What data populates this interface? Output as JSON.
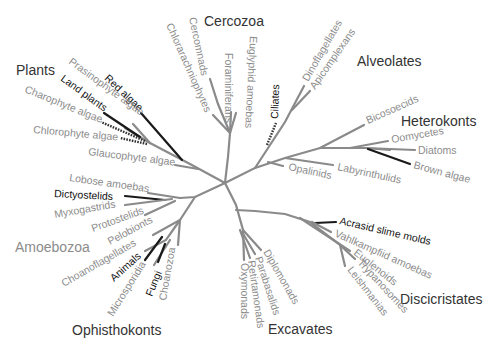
{
  "diagram": {
    "type": "unrooted phylogenetic tree",
    "colors": {
      "branch": "#8a8a8a",
      "highlight_branch": "#1a1a1a",
      "label": "#8c8c8c",
      "highlight_label": "#111111",
      "group_label": "#333333"
    },
    "groups": {
      "cercozoa": "Cercozoa",
      "alveolates": "Alveolates",
      "heterokonts": "Heterokonts",
      "plants": "Plants",
      "amoebozoa": "Amoebozoa",
      "ophisthokonts": "Ophisthokonts",
      "excavates": "Excavates",
      "discicristates": "Discicristates"
    },
    "taxa": {
      "chlorarachniophytes": "Chlorarachniophytes",
      "cercomnads": "Cercomnads",
      "foraminiferans": "Foraminiferans",
      "euglyphid_amoebas": "Euglyphid amoebas",
      "ciliates": "Ciliates",
      "dinoflagellates": "Dinoflagellates",
      "apicomplexans": "Apicomplexans",
      "bicosoecids": "Bicosoecids",
      "oomycetes": "Oomycetes",
      "diatoms": "Diatoms",
      "brown_algae": "Brown algae",
      "labyrinthulids": "Labyrinthulids",
      "opalinids": "Opalinids",
      "red_algae": "Red algae",
      "prasinophyte_algae": "Prasinophyte algae",
      "land_plants": "Land plants",
      "charophyte_algae": "Charophyte algae",
      "chlorophyte_algae": "Chlorophyte algae",
      "glaucophyte_algae": "Glaucophyte algae",
      "lobose_amoebas": "Lobose amoebas",
      "dictyostelids": "Dictyostelids",
      "myxogastrids": "Myxogastrids",
      "protostelids": "Protostelids",
      "pelobionts": "Pelobionts",
      "choanoflagellates": "Choanoflagellates",
      "animals": "Animals",
      "microsporidia": "Microsporidia",
      "fungi": "Fungi",
      "choanozoa": "Choanozoa",
      "oxymonads": "Oxymonads",
      "retirtamonads": "Retirtamonads",
      "parabasalids": "Parabasalids",
      "diplomonads": "Diplomonads",
      "acrasid_slime_molds": "Acrasid slime molds",
      "vahlkampfiid_amoebas": "Vahlkampfiid amoebas",
      "euglenoids": "Euglenoids",
      "trypanosomes": "Trypanosomes",
      "leishmanias": "Leishmanias"
    }
  }
}
